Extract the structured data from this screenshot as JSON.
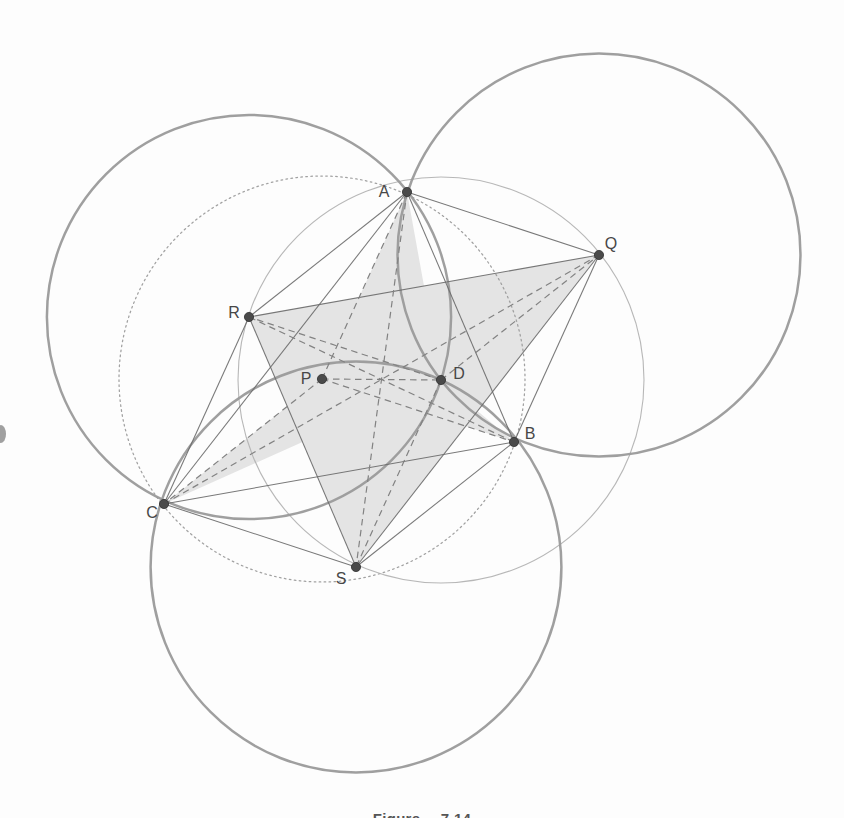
{
  "figure": {
    "caption": "Figure 7.14",
    "colors": {
      "background": "#fdfdfd",
      "thick_circle": "#9a9a9a",
      "thin_circle": "#b3b3b3",
      "dotted_circle": "#9c9c9c",
      "solid_line": "#696969",
      "dashed_line": "#828282",
      "shade": "#e4e4e4",
      "point": "#4a4a4a",
      "label": "#474747"
    },
    "points": {
      "A": {
        "x": 407,
        "y": 192,
        "label": "A",
        "label_dx": -23,
        "label_dy": -1
      },
      "B": {
        "x": 514,
        "y": 442,
        "label": "B",
        "label_dx": 16,
        "label_dy": -9
      },
      "C": {
        "x": 164,
        "y": 504,
        "label": "C",
        "label_dx": -12,
        "label_dy": 8
      },
      "D": {
        "x": 441,
        "y": 380,
        "label": "D",
        "label_dx": 18,
        "label_dy": -7
      },
      "P": {
        "x": 322,
        "y": 379,
        "label": "P",
        "label_dx": -16,
        "label_dy": -1
      },
      "Q": {
        "x": 599,
        "y": 255,
        "label": "Q",
        "label_dx": 12,
        "label_dy": -12
      },
      "R": {
        "x": 249,
        "y": 317,
        "label": "R",
        "label_dx": -15,
        "label_dy": -5
      },
      "S": {
        "x": 356,
        "y": 567,
        "label": "S",
        "label_dx": -15,
        "label_dy": 11
      }
    },
    "circles": [
      {
        "center": "Q",
        "through": [
          "D"
        ],
        "style": "thick"
      },
      {
        "center": "R",
        "through": [
          "D"
        ],
        "style": "thick"
      },
      {
        "center": "S",
        "through": [
          "D"
        ],
        "style": "thick"
      },
      {
        "center": "D",
        "through": [
          "Q",
          "R",
          "S"
        ],
        "style": "thin"
      },
      {
        "center": "P",
        "through": [
          "A",
          "B",
          "C"
        ],
        "style": "dotted"
      }
    ],
    "solid_segments": [
      [
        "A",
        "B"
      ],
      [
        "B",
        "C"
      ],
      [
        "C",
        "A"
      ],
      [
        "Q",
        "R"
      ],
      [
        "R",
        "S"
      ],
      [
        "S",
        "Q"
      ],
      [
        "Q",
        "A"
      ],
      [
        "Q",
        "B"
      ],
      [
        "R",
        "A"
      ],
      [
        "R",
        "C"
      ],
      [
        "S",
        "B"
      ],
      [
        "S",
        "C"
      ]
    ],
    "dashed_segments": [
      [
        "A",
        "S"
      ],
      [
        "B",
        "R"
      ],
      [
        "C",
        "Q"
      ],
      [
        "P",
        "D"
      ],
      [
        "P",
        "A"
      ],
      [
        "P",
        "B"
      ],
      [
        "P",
        "C"
      ],
      [
        "D",
        "Q"
      ],
      [
        "D",
        "R"
      ],
      [
        "D",
        "S"
      ]
    ],
    "shade_polygons": [
      [
        "Q",
        "R",
        "S"
      ],
      [
        "A",
        "P",
        "S",
        "D"
      ],
      [
        "B",
        "D",
        "R",
        "P"
      ],
      [
        "C",
        "D",
        "Q",
        "P"
      ]
    ],
    "edge_smudge": {
      "x": 1,
      "y": 434,
      "rx": 5,
      "ry": 9
    }
  }
}
